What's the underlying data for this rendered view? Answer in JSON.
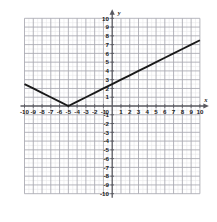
{
  "figure": {
    "kind": "coordinate-plane-graph",
    "background_color": "#ffffff",
    "grid_minor_color": "#e8e8ea",
    "grid_major_color": "#a8a8b0",
    "axis_color": "#58585f",
    "curve_color": "#1a1a1a",
    "label_color": "#1a1a1a"
  },
  "chart_data": {
    "type": "line",
    "title": "",
    "subtitle": "",
    "xlabel": "x",
    "ylabel": "y",
    "xlim": [
      -10,
      10
    ],
    "ylim": [
      -10,
      10
    ],
    "grid": true,
    "minor_grid": true,
    "grid_step": 1,
    "minor_grid_step": 0.5,
    "legend": "none",
    "equation": "y = 0.5|x + 5|",
    "vertex": [
      -5,
      0
    ],
    "slope_left": -0.5,
    "slope_right": 0.5,
    "x": [
      -10,
      -5,
      10
    ],
    "y": [
      2.5,
      0,
      7.5
    ],
    "series": [
      {
        "name": "y = 0.5|x + 5|",
        "points": [
          [
            -10,
            2.5
          ],
          [
            -9,
            2
          ],
          [
            -8,
            1.5
          ],
          [
            -7,
            1
          ],
          [
            -6,
            0.5
          ],
          [
            -5,
            0
          ],
          [
            -4,
            0.5
          ],
          [
            -3,
            1
          ],
          [
            -2,
            1.5
          ],
          [
            -1,
            2
          ],
          [
            0,
            2.5
          ],
          [
            1,
            3
          ],
          [
            2,
            3.5
          ],
          [
            3,
            4
          ],
          [
            4,
            4.5
          ],
          [
            5,
            5
          ],
          [
            6,
            5.5
          ],
          [
            7,
            6
          ],
          [
            8,
            6.5
          ],
          [
            9,
            7
          ],
          [
            10,
            7.5
          ]
        ]
      }
    ],
    "x_ticks": [
      -10,
      -9,
      -8,
      -7,
      -6,
      -5,
      -4,
      -3,
      -2,
      -1,
      0,
      1,
      2,
      3,
      4,
      5,
      6,
      7,
      8,
      9,
      10
    ],
    "y_ticks": [
      -10,
      -9,
      -8,
      -7,
      -6,
      -5,
      -4,
      -3,
      -2,
      -1,
      1,
      2,
      3,
      4,
      5,
      6,
      7,
      8,
      9,
      10
    ],
    "x_tick_labels": [
      "-10",
      "-9",
      "-8",
      "-7",
      "-6",
      "-5",
      "-4",
      "-3",
      "-2",
      "-1",
      "0",
      "1",
      "2",
      "3",
      "4",
      "5",
      "6",
      "7",
      "8",
      "9",
      "10"
    ],
    "y_tick_labels": [
      "-10",
      "-9",
      "-8",
      "-7",
      "-6",
      "-5",
      "-4",
      "-3",
      "-2",
      "-1",
      "1",
      "2",
      "3",
      "4",
      "5",
      "6",
      "7",
      "8",
      "9",
      "10"
    ],
    "origin_label": "0"
  },
  "axes": {
    "x_axis_label": "x",
    "y_axis_label": "y",
    "x_arrow": "arrow-right",
    "y_arrow": "arrow-up"
  }
}
